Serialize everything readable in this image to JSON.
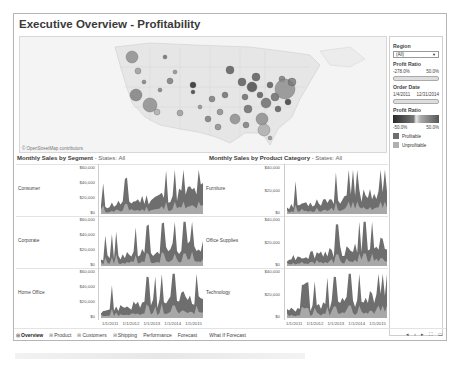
{
  "dashboard": {
    "title": "Executive Overview - Profitability",
    "map": {
      "credit": "© OpenStreetMap contributors",
      "marks": [
        {
          "x": 112,
          "y": 20,
          "r": 6,
          "c": "#8a8a8a"
        },
        {
          "x": 118,
          "y": 34,
          "r": 3,
          "c": "#999"
        },
        {
          "x": 124,
          "y": 45,
          "r": 2,
          "c": "#777"
        },
        {
          "x": 116,
          "y": 58,
          "r": 6,
          "c": "#7a7a7a"
        },
        {
          "x": 130,
          "y": 68,
          "r": 7,
          "c": "#8a8a8a"
        },
        {
          "x": 137,
          "y": 75,
          "r": 3,
          "c": "#aaa"
        },
        {
          "x": 145,
          "y": 20,
          "r": 2,
          "c": "#666"
        },
        {
          "x": 150,
          "y": 44,
          "r": 3,
          "c": "#777"
        },
        {
          "x": 155,
          "y": 35,
          "r": 2,
          "c": "#888"
        },
        {
          "x": 173,
          "y": 48,
          "r": 3,
          "c": "#222"
        },
        {
          "x": 173,
          "y": 55,
          "r": 2,
          "c": "#333"
        },
        {
          "x": 180,
          "y": 70,
          "r": 2,
          "c": "#888"
        },
        {
          "x": 192,
          "y": 62,
          "r": 3,
          "c": "#777"
        },
        {
          "x": 200,
          "y": 75,
          "r": 3,
          "c": "#888"
        },
        {
          "x": 205,
          "y": 58,
          "r": 3,
          "c": "#6a6a6a"
        },
        {
          "x": 210,
          "y": 33,
          "r": 4,
          "c": "#555"
        },
        {
          "x": 215,
          "y": 82,
          "r": 5,
          "c": "#888"
        },
        {
          "x": 222,
          "y": 45,
          "r": 4,
          "c": "#555"
        },
        {
          "x": 225,
          "y": 60,
          "r": 3,
          "c": "#666"
        },
        {
          "x": 228,
          "y": 72,
          "r": 4,
          "c": "#666"
        },
        {
          "x": 232,
          "y": 50,
          "r": 5,
          "c": "#444"
        },
        {
          "x": 236,
          "y": 40,
          "r": 4,
          "c": "#555"
        },
        {
          "x": 240,
          "y": 58,
          "r": 3,
          "c": "#555"
        },
        {
          "x": 242,
          "y": 82,
          "r": 6,
          "c": "#888"
        },
        {
          "x": 246,
          "y": 66,
          "r": 5,
          "c": "#666"
        },
        {
          "x": 250,
          "y": 48,
          "r": 3,
          "c": "#555"
        },
        {
          "x": 255,
          "y": 60,
          "r": 4,
          "c": "#666"
        },
        {
          "x": 258,
          "y": 72,
          "r": 3,
          "c": "#555"
        },
        {
          "x": 262,
          "y": 42,
          "r": 3,
          "c": "#777"
        },
        {
          "x": 265,
          "y": 52,
          "r": 10,
          "c": "#8a8a8a"
        },
        {
          "x": 268,
          "y": 65,
          "r": 3,
          "c": "#333"
        },
        {
          "x": 272,
          "y": 45,
          "r": 4,
          "c": "#777"
        },
        {
          "x": 244,
          "y": 93,
          "r": 6,
          "c": "#aaa"
        },
        {
          "x": 250,
          "y": 101,
          "r": 2,
          "c": "#888"
        },
        {
          "x": 188,
          "y": 82,
          "r": 3,
          "c": "#777"
        },
        {
          "x": 160,
          "y": 76,
          "r": 3,
          "c": "#999"
        },
        {
          "x": 140,
          "y": 53,
          "r": 2,
          "c": "#777"
        },
        {
          "x": 198,
          "y": 90,
          "r": 3,
          "c": "#888"
        },
        {
          "x": 226,
          "y": 88,
          "r": 3,
          "c": "#777"
        }
      ]
    },
    "filters": {
      "region_label": "Region",
      "region_value": "(All)",
      "profit_ratio_label": "Profit Ratio",
      "profit_ratio_min": "-278.0%",
      "profit_ratio_max": "50.0%",
      "order_date_label": "Order Date",
      "order_date_min": "1/4/2011",
      "order_date_max": "12/31/2014",
      "color_legend_label": "Profit Ratio",
      "color_legend_min": "-50.0%",
      "color_legend_max": "50.0%",
      "legend": [
        {
          "label": "Profitable",
          "color": "#6e6e6e"
        },
        {
          "label": "Unprofitable",
          "color": "#b0b0b0"
        }
      ]
    },
    "segment_chart": {
      "title": "Monthly Sales by Segment",
      "subtitle": " - States: All",
      "rows": [
        {
          "label": "Consumer",
          "yticks": [
            "$60,000",
            "$40,000",
            "$20,000",
            "$0"
          ]
        },
        {
          "label": "Corporate",
          "yticks": [
            "$60,000",
            "$40,000",
            "$20,000",
            "$0"
          ]
        },
        {
          "label": "Home Office",
          "yticks": [
            "$60,000",
            "$40,000",
            "$20,000",
            "$0"
          ]
        }
      ],
      "xticks": [
        "1/1/2011",
        "1/1/2012",
        "1/1/2013",
        "1/1/2014",
        "1/1/2015"
      ]
    },
    "category_chart": {
      "title": "Monthly Sales by Product Category",
      "subtitle": " - States: All",
      "rows": [
        {
          "label": "Furniture",
          "yticks": [
            "$40,000",
            "$20,000",
            "$0"
          ]
        },
        {
          "label": "Office Supplies",
          "yticks": [
            "$40,000",
            "$20,000",
            "$0"
          ]
        },
        {
          "label": "Technology",
          "yticks": [
            "$40,000",
            "$20,000",
            "$0"
          ]
        }
      ],
      "xticks": [
        "1/1/2011",
        "1/1/2012",
        "1/1/2013",
        "1/1/2014",
        "1/1/2015"
      ]
    },
    "series_colors": {
      "sales": "#6e6e6e",
      "profit": "#a8a8a8"
    },
    "tabs": [
      {
        "label": "Overview",
        "icon": "grid",
        "active": true
      },
      {
        "label": "Product",
        "icon": "grid",
        "active": false
      },
      {
        "label": "Customers",
        "icon": "grid",
        "active": false
      },
      {
        "label": "Shipping",
        "icon": "grid",
        "active": false
      },
      {
        "label": "Performance",
        "icon": "",
        "active": false
      },
      {
        "label": "Forecast",
        "icon": "",
        "active": false
      },
      {
        "label": "What If Forecast",
        "icon": "",
        "active": false
      }
    ],
    "nav": {
      "first": "◂",
      "prev": "‹",
      "next": "▸",
      "fullscreen": "⛶",
      "present": "▭"
    }
  }
}
